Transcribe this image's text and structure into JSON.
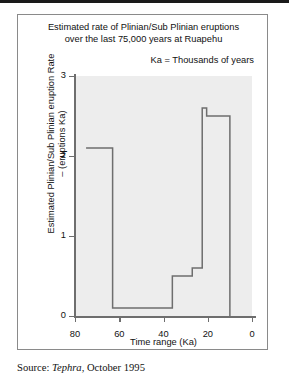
{
  "figure": {
    "title_line1": "Estimated rate of Plinian/Sub Plinian eruptions",
    "title_line2": "over the last 75,000 years at Ruapehu",
    "unit_note": "Ka = Thousands of years",
    "source_prefix": "Source:",
    "source_work": "Tephra",
    "source_rest": ", October 1995"
  },
  "chart_data": {
    "type": "line",
    "subtype": "step-post",
    "title": "Estimated rate of Plinian/Sub Plinian eruptions over the last 75,000 years at Ruapehu",
    "annotation": "Ka = Thousands of years",
    "xlabel": "Time range (Ka)",
    "ylabel": "Estimated Plinian/Sub Plinian eruption Rate – (eruptions Ka)",
    "ylabel_line1": "Estimated Plinian/Sub Plinian eruption Rate",
    "ylabel_line2": "– (eruptions Ka)",
    "xlim": [
      80,
      0
    ],
    "ylim": [
      0,
      3
    ],
    "x_reversed": true,
    "grid": false,
    "legend": null,
    "xticks": [
      80,
      60,
      40,
      20,
      0
    ],
    "xtick_labels": [
      "80",
      "60",
      "40",
      "20",
      "0"
    ],
    "yticks": [
      0,
      1,
      2,
      3
    ],
    "ytick_labels": [
      "0",
      "1",
      "2",
      "3"
    ],
    "plot_background": "#ededed",
    "line_color": "#6e6e6e",
    "steps": [
      {
        "x_start": 75.0,
        "x_end": 63.0,
        "value": 2.1
      },
      {
        "x_start": 63.0,
        "x_end": 36.0,
        "value": 0.1
      },
      {
        "x_start": 36.0,
        "x_end": 27.0,
        "value": 0.5
      },
      {
        "x_start": 27.0,
        "x_end": 22.5,
        "value": 0.6
      },
      {
        "x_start": 22.5,
        "x_end": 20.5,
        "value": 2.6
      },
      {
        "x_start": 20.5,
        "x_end": 10.0,
        "value": 2.5
      },
      {
        "x_start": 10.0,
        "x_end": 10.0,
        "value": 0.0
      }
    ]
  }
}
